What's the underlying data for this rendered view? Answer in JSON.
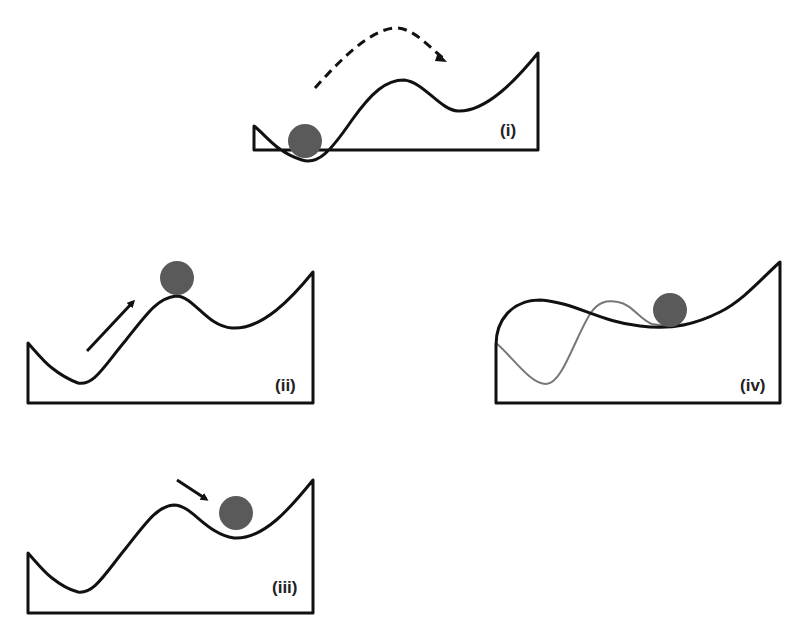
{
  "figure": {
    "colors": {
      "line": "#111111",
      "ball": "#5a5a5a",
      "alt_line": "#777777",
      "background": "#ffffff"
    },
    "panels": [
      {
        "id": "i",
        "label": "(i)",
        "arrow": "dashed-curved",
        "ball_position": "bottom of left well"
      },
      {
        "id": "ii",
        "label": "(ii)",
        "arrow": "solid-up-right",
        "ball_position": "top of central hill"
      },
      {
        "id": "iii",
        "label": "(iii)",
        "arrow": "solid-down-right",
        "ball_position": "right well"
      },
      {
        "id": "iv",
        "label": "(iv)",
        "arrow": "none",
        "ball_position": "shallow valley on reshaped landscape"
      }
    ]
  }
}
